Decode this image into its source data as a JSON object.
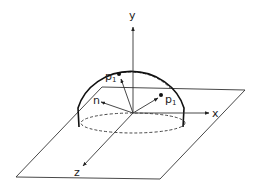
{
  "diagram": {
    "type": "hemisphere-sampling-geometry",
    "axes": {
      "x_label": "x",
      "y_label": "y",
      "z_label": "z"
    },
    "vectors": {
      "normal_label": "n"
    },
    "points": [
      {
        "label": "p",
        "subscript": "1",
        "position": "upper-left on hemisphere"
      },
      {
        "label": "p",
        "subscript": "1",
        "position": "right on hemisphere"
      }
    ],
    "colors": {
      "stroke": "#222222",
      "background": "#ffffff"
    }
  }
}
